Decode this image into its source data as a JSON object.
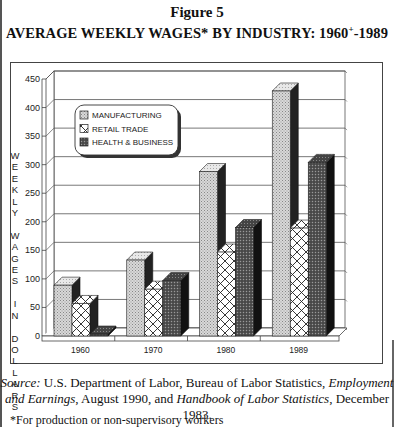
{
  "figure": {
    "label": "Figure 5",
    "title_main": "AVERAGE WEEKLY WAGES* BY INDUSTRY: 1960",
    "title_sup": "+",
    "title_end": "-1989"
  },
  "axis": {
    "ylabel_letters": [
      "W",
      "E",
      "E",
      "K",
      "L",
      "Y",
      "",
      "W",
      "A",
      "G",
      "E",
      "S",
      "",
      "I",
      "N",
      "",
      "D",
      "O",
      "L",
      "L",
      "A",
      "R",
      "S"
    ],
    "ylabel": "WEEKLY WAGES IN DOLLARS"
  },
  "source": {
    "prefix": "Source:",
    "text1": " U.S. Department of Labor, Bureau of Labor Statistics, ",
    "pub1": "Employment and Earnings",
    "text2": ", August 1990, and ",
    "pub2": "Handbook of Labor Statistics",
    "text3": ", December 1983."
  },
  "footnote": "*For production or non-supervisory workers",
  "chart_data": {
    "type": "bar",
    "title": "AVERAGE WEEKLY WAGES* BY INDUSTRY: 1960+-1989",
    "xlabel": "",
    "ylabel": "WEEKLY WAGES IN DOLLARS",
    "categories": [
      "1960",
      "1970",
      "1980",
      "1989"
    ],
    "series": [
      {
        "name": "MANUFACTURING",
        "values": [
          89,
          133,
          288,
          429
        ],
        "pattern": "light-dots"
      },
      {
        "name": "RETAIL TRADE",
        "values": [
          57,
          82,
          147,
          189
        ],
        "pattern": "crosshatch"
      },
      {
        "name": "HEALTH & BUSINESS",
        "values": [
          0,
          97,
          190,
          304
        ],
        "pattern": "dark-dots"
      }
    ],
    "ylim": [
      0,
      450
    ],
    "yticks": [
      0,
      50,
      100,
      150,
      200,
      250,
      300,
      350,
      400,
      450
    ],
    "grid": true,
    "legend_position": "upper-left-inside",
    "style": "3d-bar"
  }
}
